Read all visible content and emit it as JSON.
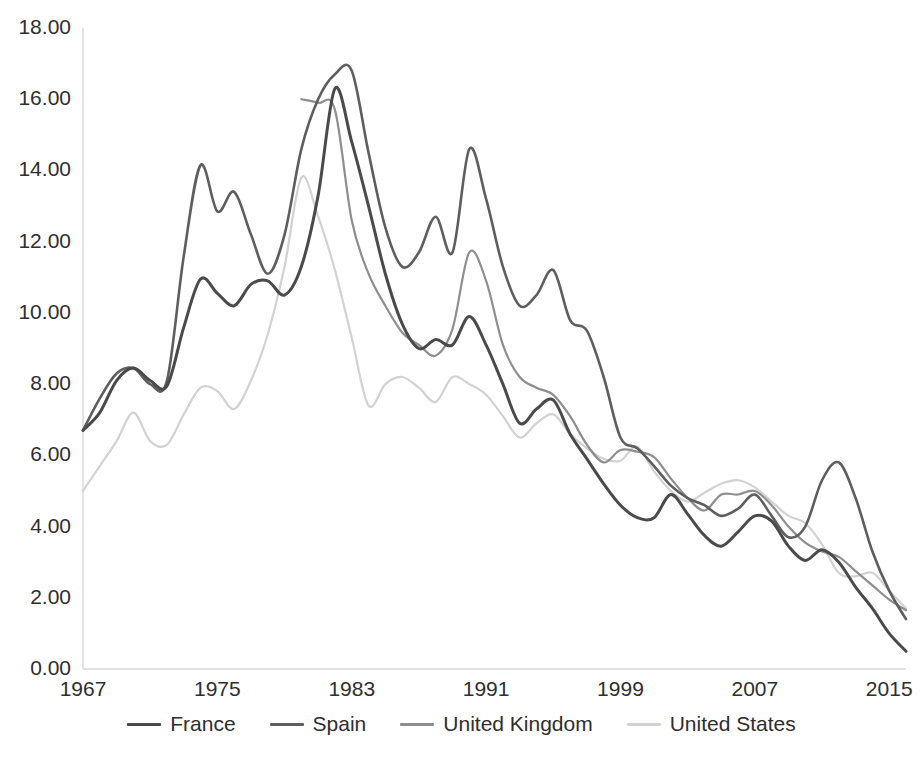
{
  "chart_data": {
    "type": "line",
    "title": "",
    "subtitle": "",
    "xlabel": "",
    "ylabel": "",
    "xlim": [
      1967,
      2016
    ],
    "ylim": [
      0.0,
      18.0
    ],
    "grid": false,
    "legend_position": "bottom",
    "x_tick_labels": [
      "1967",
      "1975",
      "1983",
      "1991",
      "1999",
      "2007",
      "2015"
    ],
    "x_tick_values": [
      1967,
      1975,
      1983,
      1991,
      1999,
      2007,
      2015
    ],
    "y_tick_labels": [
      "0.00",
      "2.00",
      "4.00",
      "6.00",
      "8.00",
      "10.00",
      "12.00",
      "14.00",
      "16.00",
      "18.00"
    ],
    "y_tick_values": [
      0,
      2,
      4,
      6,
      8,
      10,
      12,
      14,
      16,
      18
    ],
    "x": [
      1967,
      1968,
      1969,
      1970,
      1971,
      1972,
      1973,
      1974,
      1975,
      1976,
      1977,
      1978,
      1979,
      1980,
      1981,
      1982,
      1983,
      1984,
      1985,
      1986,
      1987,
      1988,
      1989,
      1990,
      1991,
      1992,
      1993,
      1994,
      1995,
      1996,
      1997,
      1998,
      1999,
      2000,
      2001,
      2002,
      2003,
      2004,
      2005,
      2006,
      2007,
      2008,
      2009,
      2010,
      2011,
      2012,
      2013,
      2014,
      2015,
      2016
    ],
    "series": [
      {
        "name": "France",
        "color": "#4a4a4a",
        "width": 3.0,
        "values": [
          6.7,
          7.2,
          8.1,
          8.45,
          8.1,
          7.95,
          9.6,
          10.95,
          10.55,
          10.2,
          10.8,
          10.9,
          10.5,
          11.3,
          13.3,
          16.3,
          14.8,
          13.0,
          11.1,
          9.7,
          9.0,
          9.25,
          9.1,
          9.9,
          9.1,
          8.0,
          6.9,
          7.3,
          7.55,
          6.6,
          5.9,
          5.2,
          4.6,
          4.25,
          4.25,
          4.9,
          4.35,
          3.75,
          3.45,
          3.85,
          4.3,
          4.15,
          3.45,
          3.05,
          3.35,
          3.0,
          2.3,
          1.7,
          1.0,
          0.5
        ]
      },
      {
        "name": "Spain",
        "color": "#5e5e5e",
        "width": 2.6,
        "values": [
          6.7,
          7.6,
          8.3,
          8.45,
          8.0,
          8.1,
          11.6,
          14.15,
          12.85,
          13.4,
          12.2,
          11.1,
          12.2,
          14.6,
          16.0,
          16.7,
          16.8,
          14.5,
          12.4,
          11.3,
          11.7,
          12.7,
          11.7,
          14.6,
          13.2,
          11.3,
          10.2,
          10.5,
          11.2,
          9.8,
          9.5,
          8.2,
          6.5,
          6.2,
          5.7,
          5.15,
          4.8,
          4.6,
          4.3,
          4.5,
          4.9,
          4.3,
          3.7,
          4.0,
          5.3,
          5.8,
          4.8,
          3.3,
          2.2,
          1.4
        ]
      },
      {
        "name": "United Kingdom",
        "color": "#8e8e8e",
        "width": 2.2,
        "values": [
          null,
          null,
          null,
          null,
          null,
          null,
          null,
          null,
          null,
          null,
          null,
          null,
          null,
          16.0,
          15.9,
          15.7,
          12.6,
          11.1,
          10.2,
          9.45,
          9.1,
          8.8,
          9.55,
          11.7,
          10.9,
          9.1,
          8.2,
          7.9,
          7.7,
          7.1,
          6.3,
          5.8,
          6.15,
          6.1,
          5.95,
          5.35,
          4.8,
          4.45,
          4.9,
          4.9,
          5.0,
          4.6,
          4.0,
          3.55,
          3.3,
          3.15,
          2.75,
          2.35,
          1.95,
          1.65
        ]
      },
      {
        "name": "United States",
        "color": "#d2d2d2",
        "width": 2.2,
        "values": [
          5.0,
          5.7,
          6.4,
          7.2,
          6.4,
          6.3,
          7.15,
          7.9,
          7.8,
          7.3,
          8.1,
          9.4,
          11.3,
          13.8,
          12.7,
          11.2,
          9.3,
          7.4,
          8.0,
          8.2,
          7.9,
          7.5,
          8.2,
          8.0,
          7.7,
          7.1,
          6.5,
          6.9,
          7.15,
          6.6,
          6.2,
          5.9,
          5.85,
          6.25,
          5.55,
          5.0,
          4.7,
          4.95,
          5.2,
          5.3,
          5.1,
          4.7,
          4.3,
          4.1,
          3.5,
          2.7,
          2.6,
          2.7,
          2.2,
          1.7
        ]
      }
    ]
  },
  "axes": {
    "axis_color": "#d9d9d9",
    "tick_text_color": "#2e2e2e"
  },
  "legend": {
    "entries": [
      {
        "label": "France",
        "color": "#4a4a4a"
      },
      {
        "label": "Spain",
        "color": "#5e5e5e"
      },
      {
        "label": "United Kingdom",
        "color": "#8e8e8e"
      },
      {
        "label": "United States",
        "color": "#d2d2d2"
      }
    ]
  }
}
